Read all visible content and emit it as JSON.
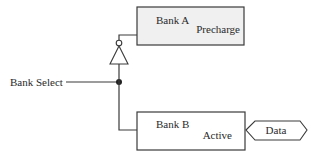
{
  "diagram": {
    "bank_select": {
      "label": "Bank Select"
    },
    "bank_a": {
      "title": "Bank A",
      "state": "Precharge",
      "fill": "#f0f0f0"
    },
    "bank_b": {
      "title": "Bank B",
      "state": "Active",
      "fill": "#ffffff"
    },
    "data_port": {
      "label": "Data"
    },
    "inverter": {
      "type": "NOT gate"
    },
    "junction": {
      "type": "connection-dot"
    }
  }
}
